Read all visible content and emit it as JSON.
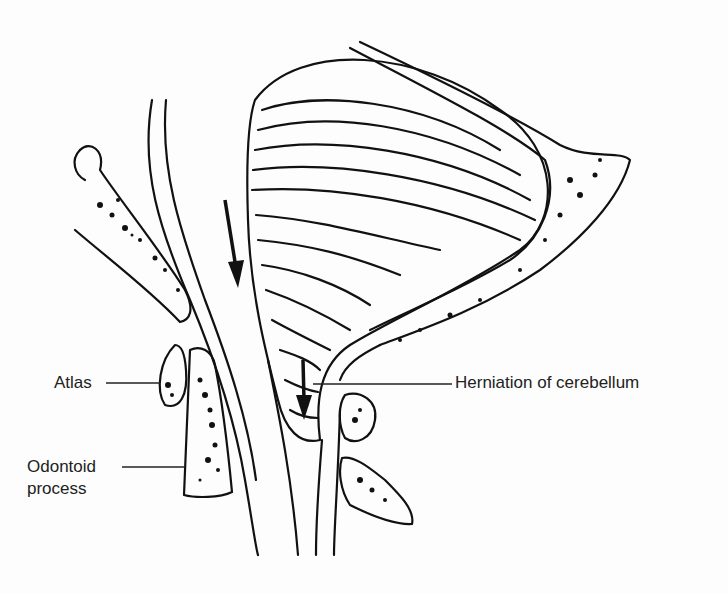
{
  "diagram": {
    "labels": {
      "atlas": "Atlas",
      "odontoid_line1": "Odontoid",
      "odontoid_line2": "process",
      "herniation": "Herniation of cerebellum"
    },
    "arrows": [
      {
        "name": "arrow-upper",
        "direction": "down"
      },
      {
        "name": "arrow-lower",
        "direction": "down"
      }
    ],
    "colors": {
      "ink": "#111111",
      "background": "#fdfdfd"
    }
  }
}
